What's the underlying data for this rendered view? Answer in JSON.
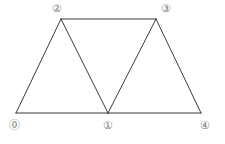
{
  "diagram": {
    "type": "triangular-mesh",
    "background_color": "#ffffff",
    "edge_color": "#3b3b3b",
    "edge_width": 1,
    "label_color": "#7a7a7a",
    "canvas": {
      "width": 225,
      "height": 144
    },
    "nodes": [
      {
        "id": "0",
        "label": "⓪",
        "x": 16,
        "y": 113,
        "label_x": 14,
        "label_y": 126
      },
      {
        "id": "1",
        "label": "①",
        "x": 108,
        "y": 113,
        "label_x": 108,
        "label_y": 126
      },
      {
        "id": "2",
        "label": "②",
        "x": 61,
        "y": 19,
        "label_x": 57,
        "label_y": 9
      },
      {
        "id": "3",
        "label": "③",
        "x": 156,
        "y": 19,
        "label_x": 166,
        "label_y": 9
      },
      {
        "id": "4",
        "label": "④",
        "x": 201,
        "y": 113,
        "label_x": 205,
        "label_y": 126
      }
    ],
    "edges": [
      {
        "from": "0",
        "to": "2"
      },
      {
        "from": "0",
        "to": "1"
      },
      {
        "from": "1",
        "to": "2"
      },
      {
        "from": "1",
        "to": "3"
      },
      {
        "from": "2",
        "to": "3"
      },
      {
        "from": "1",
        "to": "4"
      },
      {
        "from": "3",
        "to": "4"
      }
    ],
    "faces": [
      {
        "vertices": [
          "0",
          "1",
          "2"
        ]
      },
      {
        "vertices": [
          "1",
          "3",
          "2"
        ]
      },
      {
        "vertices": [
          "1",
          "4",
          "3"
        ]
      }
    ]
  }
}
